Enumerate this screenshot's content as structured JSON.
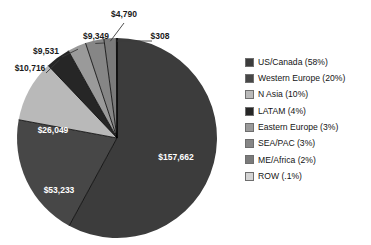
{
  "chart_data": {
    "type": "pie",
    "title": "",
    "start_angle_deg": 0,
    "direction": "clockwise",
    "grid": false,
    "legend_position": "right",
    "value_prefix": "$",
    "categories": [
      "US/Canada",
      "Western Europe",
      "N Asia",
      "LATAM",
      "Eastern Europe",
      "SEA/PAC",
      "ME/Africa",
      "ROW"
    ],
    "values": [
      157662,
      53233,
      26049,
      10716,
      9531,
      9349,
      4790,
      308
    ],
    "percent_labels": [
      "58%",
      "20%",
      "10%",
      "4%",
      "3%",
      "3%",
      "2%",
      ".1%"
    ],
    "percents": [
      58,
      20,
      10,
      4,
      3,
      3,
      2,
      0.1
    ],
    "value_labels": [
      "$157,662",
      "$53,233",
      "$26,049",
      "$10,716",
      "$9,531",
      "$9,349",
      "$4,790",
      "$308"
    ],
    "colors": [
      "#3c3c3c",
      "#474747",
      "#b9b9b9",
      "#262626",
      "#9a9a9a",
      "#868686",
      "#7a7a7a",
      "#d4d4d4"
    ],
    "legend_entries": [
      "US/Canada (58%)",
      "Western Europe (20%)",
      "N Asia (10%)",
      "LATAM (4%)",
      "Eastern Europe (3%)",
      "SEA/PAC (3%)",
      "ME/Africa (2%)",
      "ROW (.1%)"
    ]
  },
  "geometry": {
    "center_x": 117,
    "center_y": 138,
    "radius": 100
  },
  "labels": {
    "us_canada": "$157,662",
    "western_europe": "$53,233",
    "n_asia": "$26,049",
    "latam": "$10,716",
    "eastern_europe": "$9,531",
    "sea_pac": "$9,349",
    "me_africa": "$4,790",
    "row": "$308"
  }
}
